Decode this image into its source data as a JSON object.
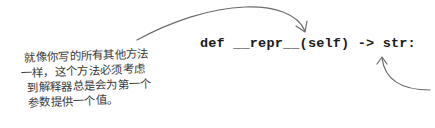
{
  "annotation": {
    "lines": [
      "就像你写的所有其他方法",
      "一样，这个方法必须考虑",
      "到解释器总是会为第一个",
      "参数提供一个值。"
    ]
  },
  "code": {
    "text": "def __repr__(self) -> str:"
  },
  "arrows": [
    {
      "name": "arrow-to-self",
      "color": "#6b6b6b"
    },
    {
      "name": "arrow-to-str",
      "color": "#6b6b6b"
    }
  ]
}
